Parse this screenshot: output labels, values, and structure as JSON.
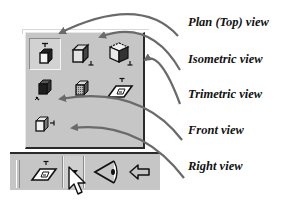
{
  "panel": {
    "rows": [
      [
        {
          "id": "plan-top",
          "icon": "plan-top-view-icon",
          "pressed": true
        },
        {
          "id": "isometric",
          "icon": "isometric-view-icon",
          "pressed": false
        },
        {
          "id": "isometric-hidden",
          "icon": "isometric-hidden-view-icon",
          "pressed": false
        }
      ],
      [
        {
          "id": "trimetric",
          "icon": "trimetric-view-icon",
          "pressed": false
        },
        {
          "id": "shaded",
          "icon": "shaded-cube-icon",
          "pressed": false
        },
        {
          "id": "top-plane",
          "icon": "top-plane-icon",
          "pressed": false
        }
      ],
      [
        {
          "id": "right",
          "icon": "right-view-icon",
          "pressed": false
        }
      ]
    ]
  },
  "toolbar": {
    "items": [
      {
        "id": "plane-view",
        "icon": "plane-view-icon"
      },
      {
        "id": "dropdown",
        "icon": "dropdown-arrow-icon"
      },
      {
        "id": "perspective",
        "icon": "perspective-eye-icon"
      },
      {
        "id": "back",
        "icon": "back-arrow-icon"
      }
    ],
    "cursor": "mouse-pointer-icon"
  },
  "labels": {
    "plan_top": "Plan (Top) view",
    "isometric": "Isometric view",
    "trimetric": "Trimetric view",
    "front": "Front view",
    "right": "Right view"
  },
  "colors": {
    "panel_bg": "#c6c6c6",
    "border_dark": "#2a2a2a",
    "arrow": "#6a6a6a"
  }
}
